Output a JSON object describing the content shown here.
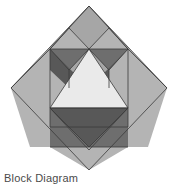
{
  "figure": {
    "name": "quilt-block-diagram",
    "caption": "Block Diagram",
    "background": "#ffffff",
    "outline_color": "#3a3a3a",
    "outline_width": 0.8,
    "palette": {
      "light": "#eaeaea",
      "medium_light": "#b4b4b4",
      "medium": "#a6a6a6",
      "dark": "#585858",
      "mid_dark": "#6e6e6e",
      "outline": "#3a3a3a"
    },
    "diamond": {
      "top": [
        89,
        6
      ],
      "right": [
        167,
        88
      ],
      "bottom": [
        89,
        170
      ],
      "left": [
        11,
        88
      ]
    },
    "shapes": [
      {
        "name": "outer-diamond-base",
        "fill": "#b4b4b4",
        "points": "89,6 167,88 89,170 11,88"
      },
      {
        "name": "corner-left-square",
        "fill": "#b4b4b4",
        "points": "11,88 50,49 89,88 50,127"
      },
      {
        "name": "corner-right-square",
        "fill": "#b4b4b4",
        "points": "167,88 128,127 89,88 128,49"
      },
      {
        "name": "top-center-diamond",
        "fill": "#a6a6a6",
        "points": "89,6 128,49 89,88 50,49"
      },
      {
        "name": "top-left-triangle-light",
        "fill": "#b4b4b4",
        "points": "50,49 69,28 89,49"
      },
      {
        "name": "top-right-triangle-light",
        "fill": "#b4b4b4",
        "points": "89,49 109,28 128,49"
      },
      {
        "name": "top-left-triangle-dark",
        "fill": "#6e6e6e",
        "points": "50,49 69,70 89,49"
      },
      {
        "name": "top-right-triangle-dark",
        "fill": "#6e6e6e",
        "points": "89,49 109,70 128,49"
      },
      {
        "name": "upper-left-wing-dark",
        "fill": "#585858",
        "points": "50,49 89,88 69,88 50,70"
      },
      {
        "name": "upper-right-wing-dark",
        "fill": "#585858",
        "points": "128,49 109,70 109,88 89,88"
      },
      {
        "name": "center-light-triangle",
        "fill": "#eaeaea",
        "points": "89,49 128,108 50,108"
      },
      {
        "name": "lower-center-dark-triangle",
        "fill": "#585858",
        "points": "50,108 128,108 89,150"
      },
      {
        "name": "lower-left-dark-triangle",
        "fill": "#6e6e6e",
        "points": "50,108 89,147 50,147"
      },
      {
        "name": "lower-right-dark-triangle",
        "fill": "#6e6e6e",
        "points": "128,108 128,147 89,147"
      },
      {
        "name": "bottom-left-light-triangle",
        "fill": "#b4b4b4",
        "points": "11,88 50,127 50,147 30,147"
      },
      {
        "name": "bottom-right-light-triangle",
        "fill": "#b4b4b4",
        "points": "167,88 148,147 128,147 128,127"
      },
      {
        "name": "bottom-center-light-triangle",
        "fill": "#b4b4b4",
        "points": "50,147 128,147 89,170"
      }
    ],
    "outlines": [
      {
        "name": "outline-outer-diamond",
        "points": "89,6 167,88 89,170 11,88"
      },
      {
        "name": "outline-inner-square",
        "points": "50,49 128,49 128,127 50,127"
      },
      {
        "name": "outline-center-light-triangle",
        "points": "89,49 128,108 50,108"
      },
      {
        "name": "outline-lower-dark-triangle",
        "points": "50,108 128,108 89,150"
      }
    ],
    "lines": [
      {
        "name": "line-top-left-peak-a",
        "x1": 50,
        "y1": 49,
        "x2": 69,
        "y2": 28
      },
      {
        "name": "line-top-left-peak-b",
        "x1": 69,
        "y1": 28,
        "x2": 89,
        "y2": 49
      },
      {
        "name": "line-top-right-peak-a",
        "x1": 89,
        "y1": 49,
        "x2": 109,
        "y2": 28
      },
      {
        "name": "line-top-right-peak-b",
        "x1": 109,
        "y1": 28,
        "x2": 128,
        "y2": 49
      },
      {
        "name": "line-top-left-valley-a",
        "x1": 50,
        "y1": 49,
        "x2": 69,
        "y2": 70
      },
      {
        "name": "line-top-left-valley-b",
        "x1": 69,
        "y1": 70,
        "x2": 89,
        "y2": 49
      },
      {
        "name": "line-top-right-valley-a",
        "x1": 89,
        "y1": 49,
        "x2": 109,
        "y2": 70
      },
      {
        "name": "line-top-right-valley-b",
        "x1": 109,
        "y1": 70,
        "x2": 128,
        "y2": 49
      },
      {
        "name": "line-left-wing-vertical",
        "x1": 69,
        "y1": 70,
        "x2": 69,
        "y2": 88
      },
      {
        "name": "line-right-wing-vertical",
        "x1": 109,
        "y1": 70,
        "x2": 109,
        "y2": 88
      },
      {
        "name": "line-top-diamond-left",
        "x1": 89,
        "y1": 6,
        "x2": 50,
        "y2": 49
      },
      {
        "name": "line-top-diamond-right",
        "x1": 89,
        "y1": 6,
        "x2": 128,
        "y2": 49
      },
      {
        "name": "line-bottom-band",
        "x1": 50,
        "y1": 147,
        "x2": 128,
        "y2": 147
      },
      {
        "name": "line-bottom-left-fold",
        "x1": 50,
        "y1": 108,
        "x2": 89,
        "y2": 147
      },
      {
        "name": "line-bottom-right-fold",
        "x1": 128,
        "y1": 108,
        "x2": 89,
        "y2": 147
      },
      {
        "name": "line-corner-left-diag",
        "x1": 11,
        "y1": 88,
        "x2": 50,
        "y2": 49
      },
      {
        "name": "line-corner-right-diag",
        "x1": 167,
        "y1": 88,
        "x2": 128,
        "y2": 49
      }
    ]
  }
}
